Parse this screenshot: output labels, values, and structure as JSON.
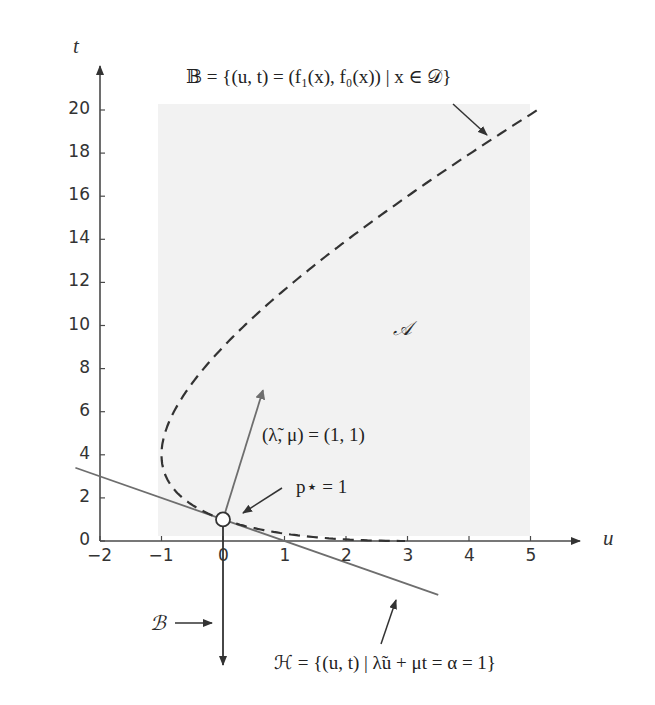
{
  "figure": {
    "axes": {
      "x_label": "u",
      "y_label": "t",
      "x_ticks": [
        "−2",
        "−1",
        "0",
        "1",
        "2",
        "3",
        "4",
        "5"
      ],
      "y_ticks": [
        "0",
        "2",
        "4",
        "6",
        "8",
        "10",
        "12",
        "14",
        "16",
        "18",
        "20"
      ]
    },
    "annotations": {
      "set_B_boundary": "𝔹 = {(u, t) = (f₁(x), f₀(x)) | x ∈ 𝒟}",
      "region_A": "𝒜",
      "dual_vector": "(λ̃, μ) = (1, 1)",
      "optimal_value": "p⋆ = 1",
      "set_B": "ℬ",
      "hyperplane_H": "ℋ = {(u, t) | λ̃u + μt = α = 1}"
    },
    "colors": {
      "axis": "#4a4a4a",
      "curve": "#333333",
      "hyperplane": "#6e6e6e",
      "region_fill": "#f2f2f2",
      "arrow": "#333333"
    }
  },
  "chart_data": {
    "type": "line",
    "title": "",
    "xlabel": "u",
    "ylabel": "t",
    "xlim": [
      -2,
      5.8
    ],
    "ylim": [
      0,
      21
    ],
    "x_ticks": [
      -2,
      -1,
      0,
      1,
      2,
      3,
      4,
      5
    ],
    "y_ticks": [
      0,
      2,
      4,
      6,
      8,
      10,
      12,
      14,
      16,
      18,
      20
    ],
    "grid": false,
    "series": [
      {
        "name": "𝔹 boundary (dashed)",
        "style": "dashed",
        "parametric": "u = x² − 1, t = (x − 2)²",
        "points": [
          [
            5.0,
            20.2
          ],
          [
            4.3,
            18.8
          ],
          [
            3.0,
            15.8
          ],
          [
            2.0,
            13.3
          ],
          [
            1.0,
            10.6
          ],
          [
            0.0,
            7.5
          ],
          [
            -0.75,
            5.5
          ],
          [
            -1.0,
            4.0
          ],
          [
            -0.75,
            2.3
          ],
          [
            0.0,
            1.0
          ],
          [
            1.0,
            0.3
          ],
          [
            2.0,
            0.05
          ],
          [
            3.0,
            0.0
          ]
        ]
      },
      {
        "name": "ℋ hyperplane (solid)",
        "style": "solid",
        "equation": "u + t = 1",
        "points": [
          [
            -2.4,
            3.4
          ],
          [
            3.5,
            -2.5
          ]
        ]
      },
      {
        "name": "ℬ ray",
        "style": "solid-arrow",
        "points": [
          [
            0,
            1
          ],
          [
            0,
            -10
          ]
        ]
      },
      {
        "name": "normal vector (λ̃, μ)",
        "style": "arrow",
        "points": [
          [
            0,
            1
          ],
          [
            0.65,
            7.0
          ]
        ]
      }
    ],
    "markers": [
      {
        "label": "p⋆ = 1",
        "u": 0,
        "t": 1,
        "shape": "open-circle"
      }
    ],
    "annotations": [
      "𝒜",
      "𝔹 = {(u, t) = (f₁(x), f₀(x)) | x ∈ 𝒟}",
      "(λ̃, μ) = (1, 1)",
      "p⋆ = 1",
      "ℬ",
      "ℋ = {(u, t) | λ̃u + μt = α = 1}"
    ]
  }
}
